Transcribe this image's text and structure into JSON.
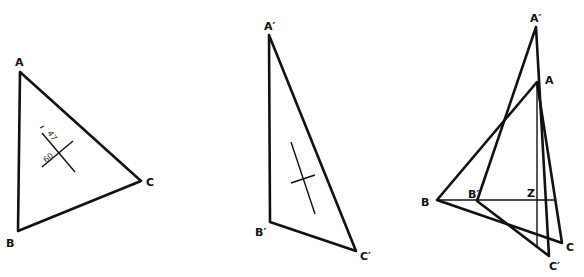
{
  "figures": [
    {
      "id": "original-triangle",
      "labels": {
        "a": "A",
        "b": "B",
        "c": "C"
      },
      "dimensions": {
        "upper": "47",
        "lower": "60"
      }
    },
    {
      "id": "transformed-triangle",
      "labels": {
        "a": "A′",
        "b": "B′",
        "c": "C′"
      }
    },
    {
      "id": "overlay",
      "labels": {
        "a": "A",
        "b": "B",
        "c": "C",
        "a_prime": "A′",
        "b_prime": "B′",
        "c_prime": "C′",
        "z": "Z"
      }
    }
  ],
  "colors": {
    "line": "#111111",
    "background": "#ffffff"
  }
}
